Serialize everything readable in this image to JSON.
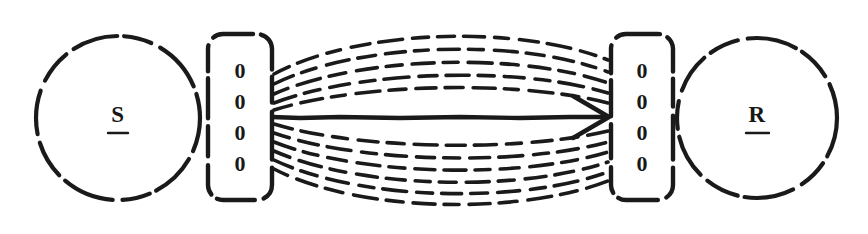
{
  "figure": {
    "kind": "s-r-connection-diagram",
    "background_color": "#ffffff",
    "ink_color": "#1a1a1a",
    "width": 868,
    "height": 234
  },
  "stimulus_node": {
    "label": "S",
    "shape": "circle",
    "underlined": true,
    "center_x": 118,
    "center_y": 118,
    "radius": 82
  },
  "response_node": {
    "label": "R",
    "shape": "circle",
    "underlined": true,
    "center_x": 757,
    "center_y": 118,
    "radius": 80
  },
  "input_register": {
    "name": "input-register",
    "shape": "rounded-rectangle",
    "digits": [
      "0",
      "0",
      "0",
      "0"
    ],
    "x": 208,
    "y": 34,
    "width": 64,
    "height": 166
  },
  "output_register": {
    "name": "output-register",
    "shape": "rounded-rectangle",
    "digits": [
      "0",
      "0",
      "0",
      "0"
    ],
    "x": 611,
    "y": 34,
    "width": 62,
    "height": 166
  },
  "connections": {
    "style": "dashed",
    "main_arrow": {
      "style": "solid",
      "direction": "right",
      "from_x": 272,
      "to_x": 611,
      "y": 117,
      "has_arrowhead": true
    },
    "upper_bundle_count": 5,
    "lower_bundle_count": 6,
    "upper_arcs": [
      {
        "y_start": 74,
        "y_end": 60,
        "bow": -46
      },
      {
        "y_start": 84,
        "y_end": 72,
        "bow": -40
      },
      {
        "y_start": 94,
        "y_end": 83,
        "bow": -34
      },
      {
        "y_start": 103,
        "y_end": 93,
        "bow": -28
      },
      {
        "y_start": 110,
        "y_end": 103,
        "bow": -21
      }
    ],
    "lower_arcs": [
      {
        "y_start": 124,
        "y_end": 131,
        "bow": 20
      },
      {
        "y_start": 133,
        "y_end": 142,
        "bow": 27
      },
      {
        "y_start": 142,
        "y_end": 152,
        "bow": 33
      },
      {
        "y_start": 151,
        "y_end": 162,
        "bow": 40
      },
      {
        "y_start": 160,
        "y_end": 172,
        "bow": 47
      },
      {
        "y_start": 169,
        "y_end": 181,
        "bow": 54
      }
    ]
  }
}
